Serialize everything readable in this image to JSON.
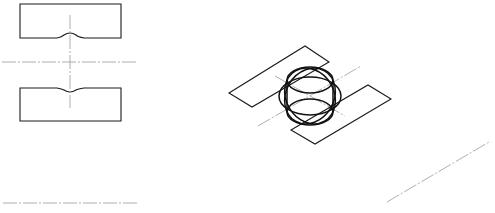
{
  "diagram": {
    "type": "technical-drawing",
    "colors": {
      "background": "#ffffff",
      "outline": "#1a1a1a",
      "centerline": "#9a9a9a"
    },
    "views": [
      {
        "name": "orthographic-view",
        "elements": [
          "upper-block-with-notch",
          "lower-block-with-notch",
          "vertical-centerline",
          "horizontal-centerline"
        ]
      },
      {
        "name": "isometric-view",
        "elements": [
          "upper-left-plate",
          "lower-right-plate",
          "sphere-ellipses",
          "axis-centerlines"
        ]
      },
      {
        "name": "ground-lines",
        "elements": [
          "bottom-left-centerline",
          "bottom-right-diagonal-centerline"
        ]
      }
    ]
  }
}
